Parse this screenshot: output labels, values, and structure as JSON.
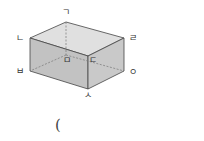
{
  "figure": {
    "type": "rectangular-prism",
    "colors": {
      "front_face": "#c2c2c2",
      "side_face": "#c9c9c9",
      "top_face": "#e0e0e0",
      "edge": "#444444",
      "hidden_edge": "#777777"
    },
    "vertices": {
      "top_back": "ㄱ",
      "top_left": "ㄴ",
      "top_right": "ㄹ",
      "hidden_back_bottom": "ㅁ",
      "front_top_right": "ㄷ",
      "bottom_left": "ㅂ",
      "bottom_right": "ㅇ",
      "bottom_front": "ㅅ"
    }
  },
  "answer": {
    "open_paren": "("
  }
}
